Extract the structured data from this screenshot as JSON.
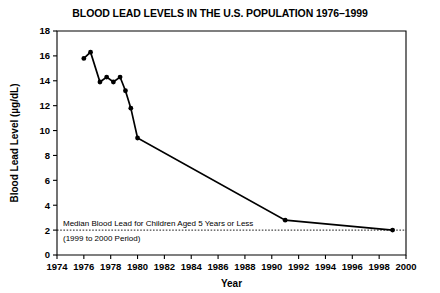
{
  "chart_data": {
    "type": "line",
    "title": "BLOOD LEAD LEVELS IN THE U.S. POPULATION 1976–1999",
    "xlabel": "Year",
    "ylabel": "Blood Lead Level  (µg/dL)",
    "xlim": [
      1974,
      2000
    ],
    "ylim": [
      0,
      18
    ],
    "xticks": [
      1974,
      1976,
      1978,
      1980,
      1982,
      1984,
      1986,
      1988,
      1990,
      1992,
      1994,
      1996,
      1998,
      2000
    ],
    "xtick_labels": [
      "1974",
      "1976",
      "1978",
      "1980",
      "1982",
      "1984",
      "1986",
      "1988",
      "1990",
      "1992",
      "1994",
      "1996",
      "1998",
      "2000"
    ],
    "yticks": [
      0,
      2,
      4,
      6,
      8,
      10,
      12,
      14,
      16,
      18
    ],
    "ytick_labels": [
      "0",
      "2",
      "4",
      "6",
      "8",
      "10",
      "12",
      "14",
      "16",
      "18"
    ],
    "grid": false,
    "legend": false,
    "line_color": "#000000",
    "marker": "filled-circle",
    "x": [
      1976.0,
      1976.5,
      1977.2,
      1977.7,
      1978.2,
      1978.7,
      1979.1,
      1979.5,
      1980.0,
      1991.0,
      1999.0
    ],
    "values": [
      15.8,
      16.3,
      13.9,
      14.3,
      13.9,
      14.3,
      13.2,
      11.8,
      9.4,
      2.8,
      2.0
    ],
    "reference_line": {
      "y": 2.0,
      "style": "dotted",
      "label_line1": "Median Blood Lead for Children Aged 5 Years or Less",
      "label_line2": "(1999 to 2000 Period)"
    }
  },
  "annotation": {
    "line1": "Median Blood Lead for Children Aged 5 Years or Less",
    "line2": "(1999 to 2000 Period)"
  }
}
